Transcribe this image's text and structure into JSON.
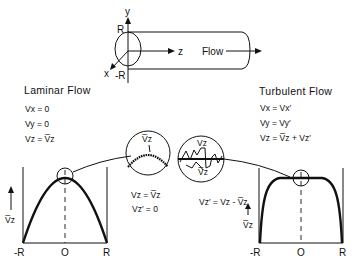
{
  "pipe": {
    "axis_y": "y",
    "axis_x": "x",
    "axis_z": "z",
    "label_R": "R",
    "label_negR": "-R",
    "flow_label": "Flow"
  },
  "laminar": {
    "title": "Laminar Flow",
    "equations": [
      "Vₓ = 0",
      "Vᵧ = 0",
      "V₂ = V̅₂"
    ],
    "eq_x": "Vx = 0",
    "eq_y": "Vy = 0",
    "eq_z": "Vz = V̅z",
    "inset_label": "V̅z",
    "inset_eq1": "Vz = V̅z",
    "inset_eq2": "Vz′ = 0",
    "axis_label": "V̅z",
    "ticks": [
      "-R",
      "O",
      "R"
    ]
  },
  "turbulent": {
    "title": "Turbulent Flow",
    "eq_x": "Vx = Vx′",
    "eq_y": "Vy = Vy′",
    "eq_z": "Vz = V̅z + Vz′",
    "inset_label_top": "Vz",
    "inset_label_bottom": "V̅z",
    "inset_eq": "Vz′ = Vz - V̅z",
    "axis_label": "V̅z",
    "ticks": [
      "-R",
      "O",
      "R"
    ]
  }
}
